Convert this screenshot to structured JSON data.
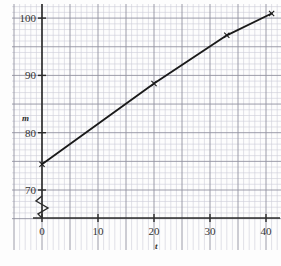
{
  "chart_data": {
    "type": "line",
    "title": "",
    "xlabel": "t",
    "ylabel": "m",
    "x": [
      0,
      41
    ],
    "values": [
      74.5,
      100.8
    ],
    "series": [
      {
        "name": "m versus t",
        "x": [
          0,
          20,
          33,
          41
        ],
        "values": [
          74.5,
          88.6,
          97.0,
          100.8
        ]
      }
    ],
    "xlim": [
      -2,
      43
    ],
    "ylim": [
      69,
      103
    ],
    "xticks": [
      0,
      10,
      20,
      30,
      40
    ],
    "xtick_labels": [
      "0",
      "10",
      "20",
      "30",
      "40"
    ],
    "yticks": [
      70,
      80,
      90,
      100
    ],
    "ytick_labels": [
      "70",
      "80",
      "90",
      "100"
    ],
    "grid": true,
    "grid_minor": true,
    "minor_step_x": 1,
    "minor_step_y": 1,
    "major_step_x": 5,
    "major_step_y": 5,
    "y_axis_break": true,
    "legend": "none",
    "colors": {
      "line": "#1a1a1a",
      "axis": "#2b2b2b",
      "grid_minor": "#c8c8d2",
      "grid_major": "#8e8e9c",
      "background": "#fdfdfd"
    },
    "markers": [
      {
        "x": 0,
        "y": 74.5,
        "shape": "cross"
      },
      {
        "x": 20,
        "y": 88.6,
        "shape": "cross"
      },
      {
        "x": 33,
        "y": 97.0,
        "shape": "cross"
      },
      {
        "x": 41,
        "y": 100.8,
        "shape": "cross"
      }
    ]
  },
  "axis": {
    "y_label": "m",
    "x_label": "t",
    "break_symbol": "zigzag"
  }
}
